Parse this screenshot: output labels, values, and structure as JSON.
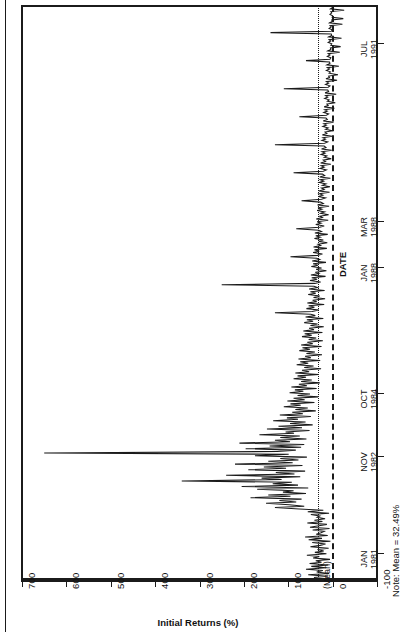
{
  "figure": {
    "note": "Note: Mean = 32.49%",
    "orientation": "rotated-90-ccw"
  },
  "chart_data": {
    "type": "line",
    "title": "",
    "xlabel": "DATE",
    "ylabel": "Initial Returns (%)",
    "ylim": [
      -100,
      700
    ],
    "yticks": [
      -100,
      0,
      100,
      200,
      300,
      400,
      500,
      600,
      700
    ],
    "ytick_labels": [
      "-100",
      "0",
      "100",
      "200",
      "300",
      "400",
      "500",
      "600",
      "700"
    ],
    "mean_label": "(Mean)",
    "mean_value": 32.49,
    "zero_line": 0,
    "grid": false,
    "legend": "none",
    "xtick_labels": [
      {
        "month": "JAN",
        "year": "1981"
      },
      {
        "month": "NOV",
        "year": "1982"
      },
      {
        "month": "OCT",
        "year": "1984"
      },
      {
        "month": "JAN",
        "year": "1988"
      },
      {
        "month": "MAR",
        "year": "1988"
      },
      {
        "month": "JUL",
        "year": "1991"
      }
    ],
    "x_start": "JAN 1981",
    "x_end": "JUL 1991",
    "series": [
      {
        "name": "Initial Returns",
        "color": "#1b1b1b",
        "values": [
          18,
          42,
          12,
          55,
          8,
          36,
          22,
          60,
          15,
          48,
          10,
          52,
          25,
          38,
          6,
          44,
          30,
          58,
          14,
          40,
          20,
          34,
          9,
          50,
          28,
          16,
          46,
          5,
          54,
          24,
          62,
          11,
          37,
          26,
          19,
          45,
          7,
          51,
          31,
          13,
          57,
          23,
          41,
          17,
          35,
          29,
          49,
          8,
          56,
          21,
          75,
          130,
          64,
          98,
          150,
          82,
          120,
          70,
          185,
          95,
          145,
          60,
          112,
          88,
          170,
          55,
          205,
          78,
          135,
          92,
          340,
          115,
          160,
          73,
          240,
          86,
          128,
          62,
          190,
          105,
          155,
          68,
          220,
          90,
          145,
          77,
          118,
          58,
          175,
          99,
          650,
          125,
          83,
          196,
          71,
          142,
          64,
          210,
          96,
          130,
          59,
          118,
          74,
          165,
          87,
          106,
          52,
          148,
          69,
          122,
          45,
          96,
          61,
          134,
          78,
          103,
          49,
          119,
          67,
          91,
          38,
          84,
          56,
          110,
          72,
          95,
          41,
          102,
          63,
          88,
          33,
          79,
          51,
          97,
          66,
          85,
          36,
          93,
          58,
          76,
          29,
          71,
          47,
          88,
          60,
          79,
          31,
          84,
          53,
          69,
          26,
          64,
          43,
          81,
          55,
          73,
          28,
          77,
          49,
          62,
          24,
          59,
          40,
          75,
          51,
          68,
          25,
          71,
          45,
          57,
          22,
          54,
          37,
          69,
          47,
          63,
          23,
          66,
          42,
          53,
          20,
          50,
          34,
          64,
          44,
          58,
          21,
          61,
          39,
          49,
          130,
          46,
          31,
          59,
          41,
          54,
          19,
          57,
          36,
          45,
          17,
          43,
          29,
          55,
          38,
          50,
          18,
          53,
          34,
          42,
          250,
          40,
          27,
          51,
          35,
          47,
          16,
          49,
          31,
          39,
          14,
          37,
          25,
          48,
          33,
          44,
          15,
          46,
          29,
          36,
          95,
          34,
          23,
          44,
          30,
          41,
          13,
          43,
          27,
          33,
          12,
          31,
          21,
          41,
          28,
          38,
          11,
          40,
          25,
          31,
          82,
          29,
          19,
          38,
          26,
          35,
          10,
          37,
          23,
          29,
          9,
          27,
          18,
          35,
          24,
          33,
          8,
          34,
          21,
          27,
          70,
          25,
          16,
          32,
          22,
          30,
          7,
          31,
          19,
          25,
          6,
          23,
          15,
          30,
          20,
          28,
          5,
          29,
          18,
          23,
          88,
          21,
          14,
          28,
          19,
          26,
          4,
          27,
          16,
          21,
          3,
          19,
          13,
          26,
          17,
          24,
          2,
          25,
          15,
          19,
          130,
          18,
          11,
          24,
          16,
          22,
          1,
          23,
          13,
          17,
          0,
          16,
          10,
          22,
          14,
          20,
          -2,
          21,
          12,
          15,
          75,
          14,
          9,
          20,
          12,
          18,
          -4,
          19,
          10,
          13,
          -6,
          12,
          8,
          18,
          11,
          16,
          -8,
          17,
          9,
          11,
          110,
          10,
          6,
          16,
          9,
          14,
          -10,
          15,
          7,
          9,
          -12,
          8,
          5,
          14,
          7,
          12,
          -14,
          13,
          6,
          7,
          60,
          6,
          4,
          12,
          6,
          10,
          -16,
          11,
          4,
          5,
          -18,
          4,
          2,
          10,
          4,
          8,
          -20,
          9,
          2,
          3,
          140,
          3,
          1,
          8,
          3,
          6,
          -22,
          7,
          1,
          2,
          -24,
          1,
          0,
          6,
          2,
          4,
          -26,
          5,
          0,
          1
        ]
      }
    ]
  }
}
